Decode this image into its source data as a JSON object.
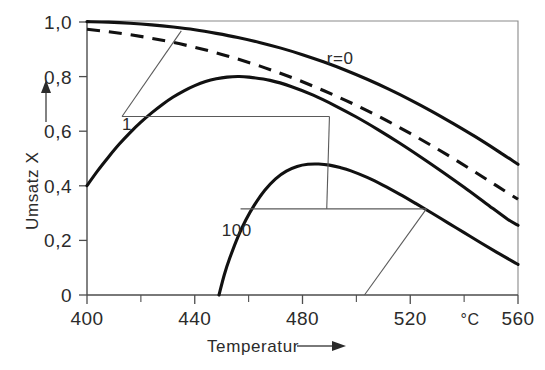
{
  "chart_data": {
    "type": "line",
    "title": "",
    "xlabel": "Temperatur",
    "ylabel": "Umsatz X",
    "x_unit": "°C",
    "xlim": [
      400,
      560
    ],
    "ylim": [
      0,
      1.0
    ],
    "grid": false,
    "legend_position": "inline-annotations",
    "x_ticks": [
      400,
      440,
      480,
      520,
      560
    ],
    "x_tick_labels": [
      "400",
      "440",
      "480",
      "520",
      "560"
    ],
    "x_minor_ticks": [
      420,
      460,
      500,
      540
    ],
    "y_ticks": [
      0,
      0.2,
      0.4,
      0.6,
      0.8,
      1.0
    ],
    "y_tick_labels": [
      "0",
      "0,2",
      "0,4",
      "0,6",
      "0,8",
      "1,0"
    ],
    "annotations": [
      {
        "text": "r=0",
        "x": 489,
        "y": 0.845,
        "name": "curve-label-r0"
      },
      {
        "text": "1",
        "x": 413,
        "y": 0.605,
        "name": "curve-label-1"
      },
      {
        "text": "100",
        "x": 450,
        "y": 0.215,
        "name": "curve-label-100"
      }
    ],
    "series": [
      {
        "name": "r=0",
        "style": "solid",
        "note": "Gleichgewichtskurve / equilibrium conversion",
        "x": [
          400,
          408,
          416,
          424,
          432,
          440,
          448,
          456,
          464,
          472,
          480,
          488,
          496,
          504,
          512,
          520,
          528,
          536,
          544,
          552,
          560
        ],
        "y": [
          1.0,
          0.998,
          0.994,
          0.988,
          0.98,
          0.97,
          0.957,
          0.942,
          0.924,
          0.903,
          0.879,
          0.852,
          0.822,
          0.789,
          0.753,
          0.714,
          0.672,
          0.627,
          0.58,
          0.53,
          0.478
        ]
      },
      {
        "name": "optimale Reaktionsfuehrung",
        "style": "dashed",
        "note": "Kurve der optimalen Temperaturfuehrung (Maxima-Verbindung)",
        "x": [
          400,
          408,
          416,
          424,
          432,
          440,
          448,
          456,
          464,
          472,
          480,
          488,
          496,
          504,
          512,
          520,
          528,
          536,
          544,
          552,
          560
        ],
        "y": [
          0.972,
          0.963,
          0.952,
          0.939,
          0.924,
          0.906,
          0.886,
          0.863,
          0.838,
          0.81,
          0.78,
          0.747,
          0.712,
          0.674,
          0.634,
          0.591,
          0.546,
          0.499,
          0.45,
          0.4,
          0.35
        ]
      },
      {
        "name": "1",
        "style": "solid",
        "note": "Umsatzkurve fuer Verweilzeitparameter r = 1",
        "x": [
          400,
          404,
          408,
          412,
          416,
          420,
          424,
          428,
          432,
          436,
          440,
          444,
          448,
          452,
          456,
          460,
          468,
          476,
          484,
          492,
          500,
          508,
          516,
          524,
          532,
          540,
          548,
          556,
          560
        ],
        "y": [
          0.4,
          0.455,
          0.505,
          0.552,
          0.594,
          0.632,
          0.666,
          0.697,
          0.724,
          0.747,
          0.766,
          0.781,
          0.791,
          0.797,
          0.799,
          0.797,
          0.785,
          0.762,
          0.731,
          0.693,
          0.651,
          0.605,
          0.556,
          0.504,
          0.45,
          0.394,
          0.336,
          0.278,
          0.255
        ]
      },
      {
        "name": "100",
        "style": "solid",
        "note": "Umsatzkurve fuer Verweilzeitparameter r = 100",
        "x": [
          449,
          451,
          453,
          456,
          459,
          462,
          466,
          470,
          474,
          478,
          482,
          486,
          490,
          494,
          498,
          504,
          510,
          516,
          522,
          528,
          534,
          540,
          546,
          552,
          558,
          560
        ],
        "y": [
          0.0,
          0.075,
          0.135,
          0.212,
          0.275,
          0.327,
          0.383,
          0.425,
          0.453,
          0.47,
          0.478,
          0.479,
          0.475,
          0.466,
          0.454,
          0.43,
          0.401,
          0.369,
          0.335,
          0.3,
          0.264,
          0.228,
          0.192,
          0.157,
          0.123,
          0.112
        ]
      }
    ],
    "operating_lines": [
      {
        "name": "adiabat-line-1",
        "style": "thin",
        "points": [
          [
            413,
            0.653
          ],
          [
            435,
            0.966
          ]
        ]
      },
      {
        "name": "isotherm-line-1",
        "style": "thin",
        "points": [
          [
            413,
            0.653
          ],
          [
            490,
            0.653
          ]
        ]
      },
      {
        "name": "adiabat-line-100",
        "style": "thin",
        "points": [
          [
            489,
            0.315
          ],
          [
            490,
            0.653
          ]
        ]
      },
      {
        "name": "isotherm-line-100",
        "style": "thin",
        "points": [
          [
            457,
            0.315
          ],
          [
            526,
            0.315
          ]
        ]
      },
      {
        "name": "adiabat-riser-100",
        "style": "thin",
        "points": [
          [
            503,
            0.0
          ],
          [
            526,
            0.315
          ]
        ]
      }
    ]
  },
  "axis_arrows": {
    "y_arrow_name": "y-axis-arrow",
    "x_arrow_name": "x-axis-arrow"
  }
}
